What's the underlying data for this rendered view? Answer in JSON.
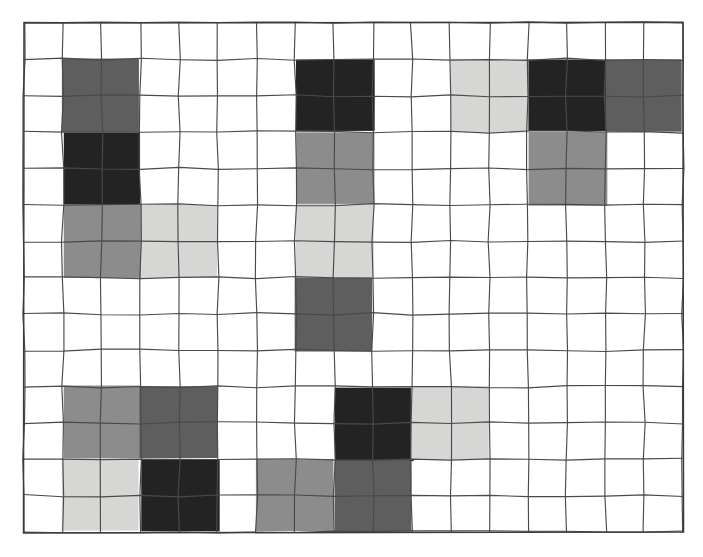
{
  "figure": {
    "title": "",
    "background_color": "#ffffff",
    "grid_line_color": "#4a4a4a",
    "grid_border_color": "#3b3b3b"
  },
  "palette": {
    "empty": "#ffffff",
    "light_gray": "#d6d6d4",
    "medium_gray": "#8c8c8c",
    "dark_gray": "#5e5e5e",
    "black": "#232323"
  },
  "chart_data": {
    "type": "heatmap",
    "title": "",
    "subtitle": "",
    "xlabel": "",
    "ylabel": "",
    "grid": true,
    "legend": "none",
    "annotations": [],
    "geometry": {
      "origin_x": 24,
      "origin_y": 23,
      "cols": 17,
      "rows": 14,
      "cell_width": 38.76,
      "cell_height": 36.36,
      "block_span_cols": 2,
      "block_span_rows": 2
    },
    "x_tick_labels": [],
    "y_tick_labels": [],
    "categories": [
      "empty",
      "light_gray",
      "medium_gray",
      "dark_gray",
      "black"
    ],
    "values": [
      5,
      6,
      7,
      6,
      5
    ],
    "blocks": [
      {
        "id": "b01",
        "col": 1,
        "row": 1,
        "tone": "dark_gray",
        "color": "#5e5e5e"
      },
      {
        "id": "b02",
        "col": 7,
        "row": 1,
        "tone": "black",
        "color": "#232323"
      },
      {
        "id": "b03",
        "col": 11,
        "row": 1,
        "tone": "light_gray",
        "color": "#d6d6d4"
      },
      {
        "id": "b04",
        "col": 13,
        "row": 1,
        "tone": "black",
        "color": "#232323"
      },
      {
        "id": "b05",
        "col": 15,
        "row": 1,
        "tone": "dark_gray",
        "color": "#5e5e5e"
      },
      {
        "id": "b06",
        "col": 1,
        "row": 3,
        "tone": "black",
        "color": "#232323"
      },
      {
        "id": "b07",
        "col": 7,
        "row": 3,
        "tone": "medium_gray",
        "color": "#8c8c8c"
      },
      {
        "id": "b08",
        "col": 13,
        "row": 3,
        "tone": "medium_gray",
        "color": "#8c8c8c"
      },
      {
        "id": "b09",
        "col": 1,
        "row": 5,
        "tone": "medium_gray",
        "color": "#8c8c8c"
      },
      {
        "id": "b10",
        "col": 3,
        "row": 5,
        "tone": "light_gray",
        "color": "#d6d6d4"
      },
      {
        "id": "b11",
        "col": 7,
        "row": 5,
        "tone": "light_gray",
        "color": "#d6d6d4"
      },
      {
        "id": "b12",
        "col": 7,
        "row": 7,
        "tone": "dark_gray",
        "color": "#5e5e5e"
      },
      {
        "id": "b13",
        "col": 1,
        "row": 10,
        "tone": "medium_gray",
        "color": "#8c8c8c"
      },
      {
        "id": "b14",
        "col": 3,
        "row": 10,
        "tone": "dark_gray",
        "color": "#5e5e5e"
      },
      {
        "id": "b15",
        "col": 8,
        "row": 10,
        "tone": "black",
        "color": "#232323"
      },
      {
        "id": "b16",
        "col": 10,
        "row": 10,
        "tone": "light_gray",
        "color": "#d6d6d4"
      },
      {
        "id": "b17",
        "col": 1,
        "row": 12,
        "tone": "light_gray",
        "color": "#d6d6d4"
      },
      {
        "id": "b18",
        "col": 3,
        "row": 12,
        "tone": "black",
        "color": "#232323"
      },
      {
        "id": "b19",
        "col": 6,
        "row": 12,
        "tone": "medium_gray",
        "color": "#8c8c8c"
      },
      {
        "id": "b20",
        "col": 8,
        "row": 12,
        "tone": "dark_gray",
        "color": "#5e5e5e"
      }
    ]
  }
}
